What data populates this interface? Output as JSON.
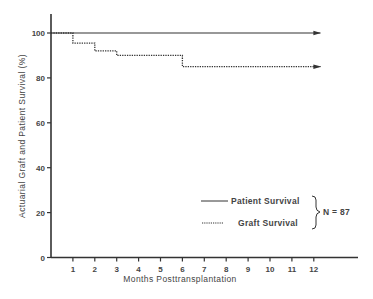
{
  "chart_data": {
    "type": "line",
    "title": "",
    "xlabel": "Months Posttransplantation",
    "ylabel": "Actuarial Graft and Patient Survival (%)",
    "xlim": [
      0,
      14
    ],
    "ylim": [
      0,
      105
    ],
    "x_ticks": [
      "1",
      "2",
      "3",
      "4",
      "5",
      "6",
      "7",
      "8",
      "9",
      "10",
      "11",
      "12"
    ],
    "y_ticks": [
      "0",
      "20",
      "40",
      "60",
      "80",
      "100"
    ],
    "grid": false,
    "legend_position": "lower right",
    "series": [
      {
        "name": "Patient Survival",
        "style": "solid",
        "step": true,
        "x": [
          0,
          12
        ],
        "values": [
          100,
          100
        ],
        "arrow_continuation": true
      },
      {
        "name": "Graft Survival",
        "style": "dotted",
        "step": true,
        "x": [
          0,
          1,
          2,
          3,
          6,
          12
        ],
        "values": [
          100,
          95.5,
          92,
          90,
          85,
          85
        ],
        "arrow_continuation": true
      }
    ],
    "annotations": [
      {
        "text": "N = 87",
        "position": "right of legend, bracketed"
      }
    ]
  },
  "legend": {
    "patient": "Patient Survival",
    "graft": "Graft Survival",
    "n_label": "N = 87"
  },
  "axes": {
    "xlabel": "Months Posttransplantation",
    "ylabel": "Actuarial Graft and Patient Survival (%)"
  },
  "colors": {
    "line": "#333333",
    "text": "#444444",
    "background": "#ffffff"
  }
}
